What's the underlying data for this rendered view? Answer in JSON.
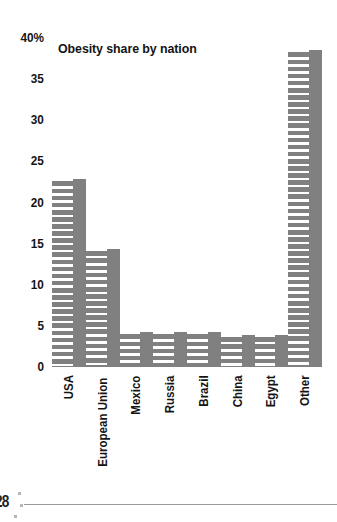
{
  "chart_data": {
    "type": "bar",
    "title": "Obesity share by nation",
    "xlabel": "",
    "ylabel": "",
    "categories": [
      "USA",
      "European Union",
      "Mexico",
      "Russia",
      "Brazil",
      "China",
      "Egypt",
      "Other"
    ],
    "values": [
      22.8,
      14.4,
      4.2,
      4.3,
      4.3,
      3.9,
      3.9,
      38.5
    ],
    "ylim": [
      0,
      40
    ],
    "ytick_labels": [
      "40%",
      "35",
      "30",
      "25",
      "20",
      "15",
      "10",
      "5",
      "0"
    ],
    "ytick_values": [
      40,
      35,
      30,
      25,
      20,
      15,
      10,
      5,
      0
    ],
    "grid": false,
    "legend": null,
    "bar_color": "#808080",
    "bar_pattern": "horizontal-white-hatch",
    "background_color": "#ffffff",
    "text_color": "#141414"
  },
  "footer": {
    "page_number": "28"
  }
}
